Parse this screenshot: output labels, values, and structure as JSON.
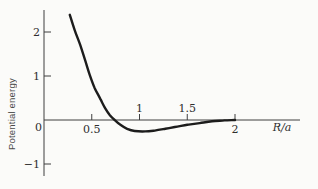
{
  "chart_data": {
    "type": "line",
    "title": "",
    "ylabel": "Potential energy",
    "xlabel": "R/a",
    "xlim": [
      0,
      2.68
    ],
    "ylim": [
      -1.36,
      2.5
    ],
    "grid": false,
    "legend": "none",
    "origin_label": "0",
    "x_ticks": [
      {
        "value": 0.5,
        "label": "0.5",
        "label_side": "below"
      },
      {
        "value": 1.0,
        "label": "1",
        "label_side": "above"
      },
      {
        "value": 1.5,
        "label": "1.5",
        "label_side": "above"
      },
      {
        "value": 2.0,
        "label": "2",
        "label_side": "below"
      }
    ],
    "y_ticks": [
      {
        "value": 2,
        "label": "2"
      },
      {
        "value": 1,
        "label": "1"
      },
      {
        "value": -1,
        "label": "−1"
      }
    ],
    "series": [
      {
        "name": "potential-energy-curve",
        "points": [
          [
            0.27,
            2.39
          ],
          [
            0.32,
            2.05
          ],
          [
            0.38,
            1.7
          ],
          [
            0.43,
            1.36
          ],
          [
            0.48,
            1.02
          ],
          [
            0.53,
            0.73
          ],
          [
            0.59,
            0.48
          ],
          [
            0.64,
            0.27
          ],
          [
            0.69,
            0.11
          ],
          [
            0.74,
            0.0
          ],
          [
            0.8,
            -0.11
          ],
          [
            0.87,
            -0.2
          ],
          [
            0.95,
            -0.25
          ],
          [
            1.06,
            -0.26
          ],
          [
            1.16,
            -0.24
          ],
          [
            1.27,
            -0.2
          ],
          [
            1.37,
            -0.16
          ],
          [
            1.5,
            -0.11
          ],
          [
            1.63,
            -0.07
          ],
          [
            1.76,
            -0.03
          ],
          [
            1.89,
            -0.01
          ],
          [
            2.0,
            0.0
          ]
        ]
      }
    ],
    "colors": {
      "curve": "#1c1c1c",
      "axis": "#3f3f3f",
      "text": "#2e2e2e",
      "background": "#fbfbf9"
    }
  }
}
